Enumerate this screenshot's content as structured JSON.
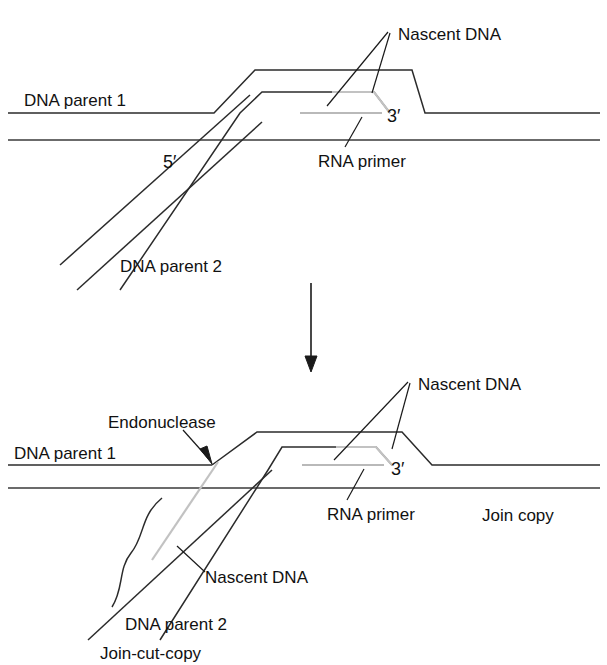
{
  "figure": {
    "background_color": "#ffffff",
    "line_color": "#2b2b2b",
    "primer_color": "#b9b9b9",
    "nascent_gray_color": "#c2c2c2"
  },
  "panels": [
    {
      "id": "top-panel",
      "name": "join-copy-stage",
      "labels": {
        "nascent_dna": "Nascent DNA",
        "dna_parent_1": "DNA parent 1",
        "dna_parent_2": "DNA parent 2",
        "rna_primer": "RNA primer",
        "five_prime": "5′",
        "three_prime": "3′"
      }
    },
    {
      "id": "bottom-panel",
      "name": "join-cut-copy-stage",
      "labels": {
        "nascent_dna_top": "Nascent DNA",
        "nascent_dna_lower": "Nascent DNA",
        "endonuclease": "Endonuclease",
        "dna_parent_1": "DNA parent 1",
        "dna_parent_2": "DNA parent 2",
        "rna_primer": "RNA primer",
        "join_copy": "Join copy",
        "join_cut_copy": "Join-cut-copy",
        "three_prime": "3′"
      }
    }
  ],
  "flow_arrow": {
    "name": "downward-process-arrow",
    "direction": "down"
  }
}
